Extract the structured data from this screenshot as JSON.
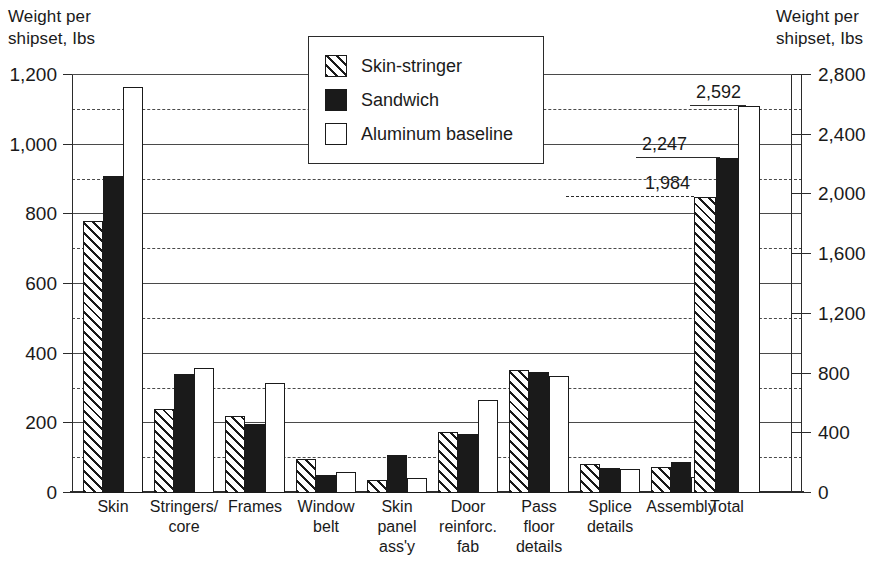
{
  "left_axis_caption": "Weight per\nshipset, Ibs",
  "right_axis_caption": "Weight per\nshipset, Ibs",
  "legend": {
    "items": [
      {
        "label": "Skin-stringer",
        "style": "hatch",
        "icon": "hatched-square-icon"
      },
      {
        "label": "Sandwich",
        "style": "solid",
        "icon": "filled-square-icon"
      },
      {
        "label": "Aluminum baseline",
        "style": "open",
        "icon": "empty-square-icon"
      }
    ]
  },
  "chart_data": {
    "type": "bar",
    "title": "",
    "subtitle": "",
    "xlabel": "",
    "ylabel": "Weight per shipset, Ibs",
    "y2label": "Weight per shipset, Ibs",
    "ylim": [
      0,
      1200
    ],
    "y2lim": [
      0,
      2800
    ],
    "yticks": [
      0,
      200,
      400,
      600,
      800,
      1000,
      1200
    ],
    "ytick_labels": [
      "0",
      "200",
      "400",
      "600",
      "800",
      "1,000",
      "1,200"
    ],
    "y2ticks": [
      0,
      400,
      800,
      1200,
      1600,
      2000,
      2400,
      2800
    ],
    "y2tick_labels": [
      "0",
      "400",
      "800",
      "1,200",
      "1,600",
      "2,000",
      "2,400",
      "2,800"
    ],
    "grid": "horizontal solid at left-axis 200-multiples, dashed midway (right-axis 400-multiples)",
    "legend_position": "top-center inside plot",
    "categories": [
      "Skin",
      "Stringers/\ncore",
      "Frames",
      "Window\nbelt",
      "Skin\npanel\nass'y",
      "Door\nreinforc.\nfab",
      "Pass\nfloor\ndetails",
      "Splice\ndetails",
      "Assembly",
      "Total"
    ],
    "series": [
      {
        "name": "Skin-stringer",
        "values": [
          780,
          240,
          220,
          97,
          38,
          175,
          352,
          83,
          75,
          1984
        ]
      },
      {
        "name": "Sandwich",
        "values": [
          910,
          343,
          197,
          53,
          110,
          170,
          347,
          72,
          90,
          2247
        ]
      },
      {
        "name": "Aluminum baseline",
        "values": [
          1165,
          358,
          317,
          60,
          42,
          268,
          337,
          70,
          45,
          2592
        ]
      }
    ],
    "annotations": [
      {
        "text": "1,984",
        "series": "Skin-stringer",
        "category": "Total",
        "value": 1984
      },
      {
        "text": "2,247",
        "series": "Sandwich",
        "category": "Total",
        "value": 2247
      },
      {
        "text": "2,592",
        "series": "Aluminum baseline",
        "category": "Total",
        "value": 2592
      }
    ]
  }
}
